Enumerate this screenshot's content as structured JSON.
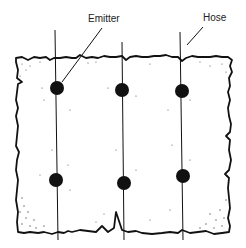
{
  "diagram": {
    "labels": {
      "emitter": "Emitter",
      "hose": "Hose"
    },
    "hoses": [
      {
        "x_top": 55,
        "y_top": 30,
        "x_bottom": 58,
        "y_bottom": 240
      },
      {
        "x_top": 122,
        "y_top": 42,
        "x_bottom": 124,
        "y_bottom": 240
      },
      {
        "x_top": 180,
        "y_top": 32,
        "x_bottom": 183,
        "y_bottom": 240
      }
    ],
    "emitters": [
      {
        "cx": 57,
        "cy": 88
      },
      {
        "cx": 122,
        "cy": 90
      },
      {
        "cx": 182,
        "cy": 91
      },
      {
        "cx": 56,
        "cy": 180
      },
      {
        "cx": 124,
        "cy": 183
      },
      {
        "cx": 183,
        "cy": 176
      }
    ]
  }
}
